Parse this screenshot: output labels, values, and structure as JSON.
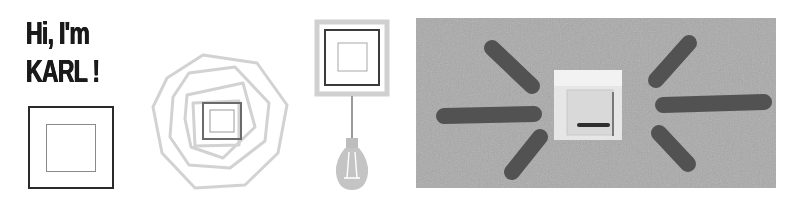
{
  "headline": {
    "line1": "Hi, I'm",
    "line2": "KARL !"
  },
  "illustrations": [
    {
      "name": "framed-square",
      "description": "Black square frame with grey inner square"
    },
    {
      "name": "nested-polygons",
      "description": "Concentric pale grey polygons around a square switch"
    },
    {
      "name": "switch-with-bulb",
      "description": "Square switch hanging to a light bulb by a cord"
    },
    {
      "name": "switch-photo",
      "description": "Photo of a wall light switch with dark radiating stripes"
    }
  ],
  "colors": {
    "text": "#1a1a1a",
    "outline_dark": "#2a2a2a",
    "outline_light": "#cfcfcf",
    "photo_wall": "#a6a6a6",
    "photo_stripes": "#505050",
    "switch_plate": "#e4e4e4"
  }
}
